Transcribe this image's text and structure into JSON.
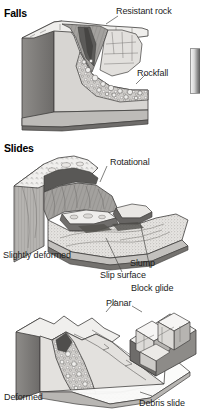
{
  "figure": {
    "title_fragment": "",
    "sections": [
      {
        "id": "falls",
        "heading": "Falls",
        "labels": [
          {
            "name": "resistant-rock",
            "text": "Resistant rock"
          },
          {
            "name": "rockfall",
            "text": "Rockfall"
          }
        ]
      },
      {
        "id": "slides",
        "heading": "Slides",
        "labels": [
          {
            "name": "rotational",
            "text": "Rotational"
          },
          {
            "name": "slightly-deformed",
            "text": "Slightly deformed"
          },
          {
            "name": "slump",
            "text": "Slump"
          },
          {
            "name": "slip-surface",
            "text": "Slip surface"
          },
          {
            "name": "planar",
            "text": "Planar"
          },
          {
            "name": "block-glide",
            "text": "Block glide"
          },
          {
            "name": "deformed",
            "text": "Deformed"
          },
          {
            "name": "debris-slide",
            "text": "Debris slide"
          }
        ]
      }
    ],
    "colors": {
      "ink": "#1c1c1c",
      "outline": "#3a3a3a",
      "rock_light": "#eceae7",
      "rock_mid": "#b9b7b4",
      "rock_dark": "#7b7a78",
      "rock_darker": "#5a5957",
      "shadow": "#4a4a48",
      "background": "#ffffff"
    }
  }
}
